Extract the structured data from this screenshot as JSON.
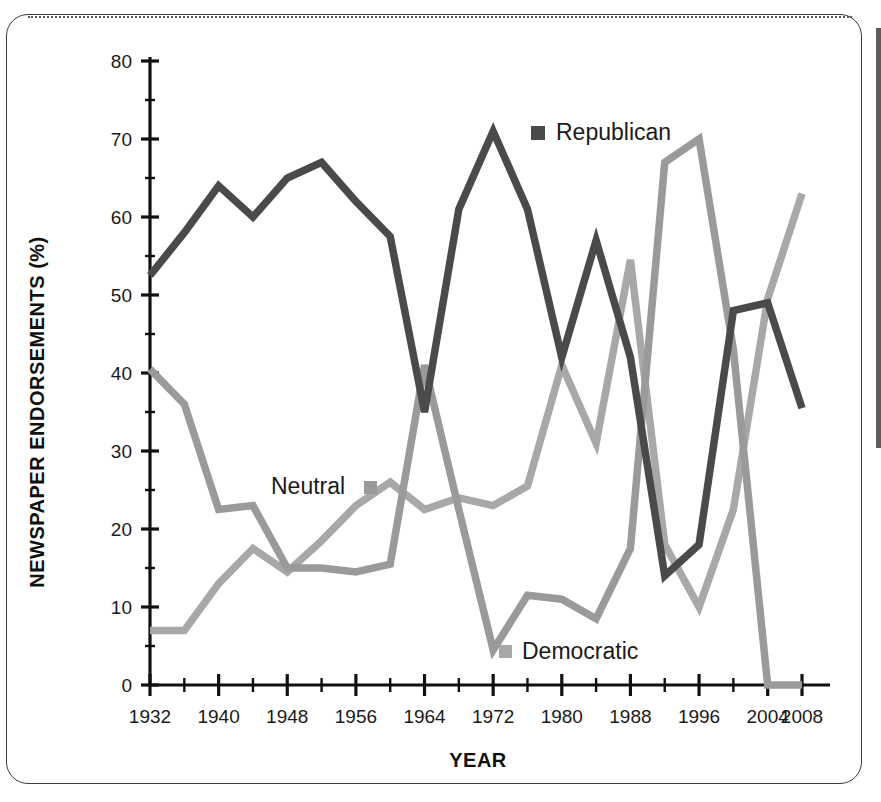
{
  "chart_data": {
    "type": "line",
    "title": "",
    "xlabel": "YEAR",
    "ylabel": "NEWSPAPER ENDORSEMENTS (%)",
    "xlim": [
      1932,
      2008
    ],
    "ylim": [
      0,
      80
    ],
    "yticks": [
      0,
      10,
      20,
      30,
      40,
      50,
      60,
      70,
      80
    ],
    "ytick_labels": [
      "0",
      "10",
      "20",
      "30",
      "40",
      "50",
      "60",
      "70",
      "80"
    ],
    "xticks_major": [
      1932,
      1940,
      1948,
      1956,
      1964,
      1972,
      1980,
      1988,
      1996,
      2004,
      2008
    ],
    "xtick_labels": [
      "1932",
      "1940",
      "1948",
      "1956",
      "1964",
      "1972",
      "1980",
      "1988",
      "1996",
      "2004",
      "2008"
    ],
    "xticks_minor": [
      1936,
      1944,
      1952,
      1960,
      1968,
      1976,
      1984,
      1992,
      2000
    ],
    "x": [
      1932,
      1936,
      1940,
      1944,
      1948,
      1952,
      1956,
      1960,
      1964,
      1968,
      1972,
      1976,
      1980,
      1984,
      1988,
      1992,
      1996,
      2000,
      2004,
      2008
    ],
    "grid": false,
    "legend_position": "inline",
    "series": [
      {
        "name": "Republican",
        "color": "#4a4a4a",
        "marker": "square",
        "values": [
          52.5,
          58,
          64,
          60,
          65,
          67,
          62,
          57.5,
          35,
          61,
          71,
          61,
          42,
          57,
          42,
          14,
          18,
          48,
          49,
          35.5
        ]
      },
      {
        "name": "Neutral",
        "color": "#9a9a9a",
        "marker": "square",
        "values": [
          40.5,
          36,
          22.5,
          23,
          15,
          15,
          14.5,
          15.5,
          41,
          22.5,
          4.5,
          11.5,
          11,
          8.5,
          17.5,
          67,
          70,
          43,
          0,
          0
        ]
      },
      {
        "name": "Democratic",
        "color": "#a8a8a8",
        "marker": "square",
        "values": [
          7,
          7,
          13,
          17.5,
          14.5,
          18.5,
          23,
          26,
          22.5,
          24,
          23,
          25.5,
          41,
          31,
          54.5,
          18,
          10,
          22.5,
          49.5,
          63
        ]
      }
    ],
    "legend": [
      {
        "label": "Republican",
        "color": "#4a4a4a"
      },
      {
        "label": "Neutral",
        "color": "#9a9a9a"
      },
      {
        "label": "Democratic",
        "color": "#a8a8a8"
      }
    ]
  }
}
